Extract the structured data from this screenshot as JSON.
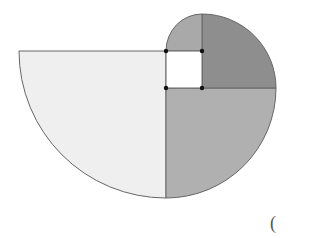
{
  "diagram": {
    "type": "golden-spiral-quarter-circles",
    "colors": {
      "white_square": "#ffffff",
      "medium_top_left": "#a8a8a8",
      "dark_top_right": "#8c8c8c",
      "medium_bottom_right": "#b0b0b0",
      "light_left": "#efefef",
      "stroke": "#555555",
      "dot": "#111111"
    },
    "points": [
      {
        "x": 166,
        "y": 51
      },
      {
        "x": 202,
        "y": 51
      },
      {
        "x": 166,
        "y": 88
      },
      {
        "x": 202,
        "y": 88
      }
    ]
  },
  "footer": {
    "paren": "("
  }
}
